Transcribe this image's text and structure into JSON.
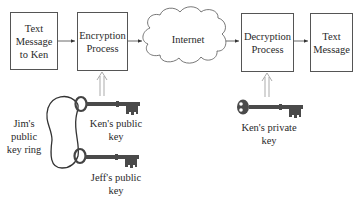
{
  "diagram": {
    "nodes": {
      "source": {
        "lines": [
          "Text",
          "Message",
          "to Ken"
        ]
      },
      "encrypt": {
        "lines": [
          "Encryption",
          "Process"
        ]
      },
      "internet": {
        "label": "Internet"
      },
      "decrypt": {
        "lines": [
          "Decryption",
          "Process"
        ]
      },
      "dest": {
        "lines": [
          "Text",
          "Message"
        ]
      }
    },
    "labels": {
      "key_ring": [
        "Jim's",
        "public",
        "key ring"
      ],
      "ken_public": [
        "Ken's public",
        "key"
      ],
      "jeff_public": [
        "Jeff's public",
        "key"
      ],
      "ken_private": [
        "Ken's private",
        "key"
      ]
    },
    "edges": [
      {
        "from": "source",
        "to": "encrypt"
      },
      {
        "from": "encrypt",
        "to": "internet"
      },
      {
        "from": "internet",
        "to": "decrypt"
      },
      {
        "from": "decrypt",
        "to": "dest"
      },
      {
        "from": "ken_public",
        "to": "encrypt",
        "style": "double"
      },
      {
        "from": "ken_private",
        "to": "decrypt",
        "style": "double"
      }
    ]
  }
}
